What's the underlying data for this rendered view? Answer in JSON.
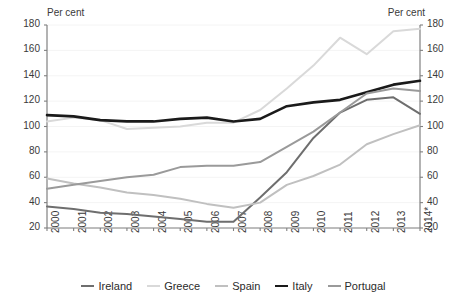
{
  "axis_unit_left": "Per cent",
  "axis_unit_right": "Per cent",
  "chart_data": {
    "type": "line",
    "title": "",
    "subtitle": "",
    "xlabel": "",
    "ylabel": "Per cent",
    "ylabel_right": "Per cent",
    "ylim": [
      20,
      180
    ],
    "ytick_step": 20,
    "yticks": [
      20,
      40,
      60,
      80,
      100,
      120,
      140,
      160,
      180
    ],
    "yticks_right": [
      20,
      40,
      60,
      80,
      100,
      120,
      140,
      160,
      180
    ],
    "grid": true,
    "grid_axis": "y",
    "legend_position": "bottom",
    "dual_axis": true,
    "footnote_marker": "*",
    "categories": [
      "2000",
      "2001",
      "2002",
      "2003",
      "2004",
      "2005",
      "2006",
      "2007",
      "2008",
      "2009",
      "2010",
      "2011",
      "2012",
      "2013",
      "2014*"
    ],
    "x": [
      2000,
      2001,
      2002,
      2003,
      2004,
      2005,
      2006,
      2007,
      2008,
      2009,
      2010,
      2011,
      2012,
      2013,
      2014
    ],
    "series": [
      {
        "name": "Ireland",
        "color": "#6e6e6e",
        "width": 2.0,
        "values": [
          37,
          35,
          32,
          31,
          29,
          27,
          25,
          25,
          44,
          64,
          91,
          111,
          121,
          123,
          110
        ]
      },
      {
        "name": "Greece",
        "color": "#d9d9d9",
        "width": 2.0,
        "values": [
          104,
          107,
          105,
          98,
          99,
          100,
          103,
          103,
          113,
          130,
          148,
          170,
          157,
          175,
          177
        ]
      },
      {
        "name": "Spain",
        "color": "#c0c0c0",
        "width": 2.0,
        "values": [
          59,
          55,
          52,
          48,
          46,
          43,
          39,
          36,
          40,
          54,
          61,
          70,
          86,
          94,
          101
        ]
      },
      {
        "name": "Italy",
        "color": "#1a1a1a",
        "width": 2.6,
        "values": [
          109,
          108,
          105,
          104,
          104,
          106,
          107,
          104,
          106,
          116,
          119,
          121,
          127,
          133,
          136
        ]
      },
      {
        "name": "Portugal",
        "color": "#9a9a9a",
        "width": 2.0,
        "values": [
          51,
          54,
          57,
          60,
          62,
          68,
          69,
          69,
          72,
          84,
          96,
          111,
          126,
          130,
          128
        ]
      }
    ]
  }
}
